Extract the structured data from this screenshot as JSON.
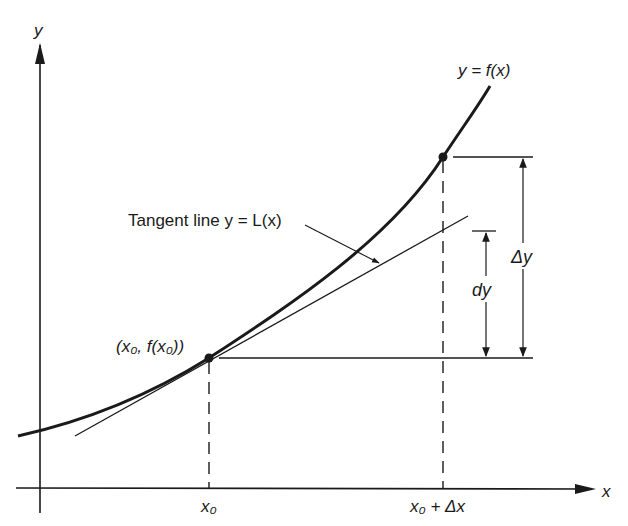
{
  "diagram": {
    "axes": {
      "x_label": "x",
      "y_label": "y"
    },
    "curve": {
      "label": "y = f(x)"
    },
    "tangent": {
      "label": "Tangent line y = L(x)"
    },
    "points": {
      "base_point_label": "(x₀, f(x₀))",
      "x0_tick_label": "x₀",
      "x0_dx_tick_label": "x₀ + Δx"
    },
    "measures": {
      "dy_label": "dy",
      "delta_y_label": "Δy"
    },
    "colors": {
      "ink": "#1a1a1a",
      "background": "#ffffff"
    }
  }
}
